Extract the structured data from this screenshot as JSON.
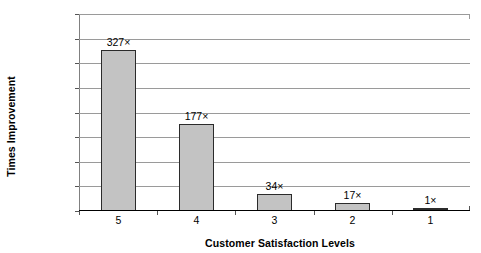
{
  "chart_data": {
    "type": "bar",
    "title": "",
    "subtitle": "",
    "xlabel": "Customer Satisfaction Levels",
    "ylabel": "Times Improvement",
    "categories": [
      "5",
      "4",
      "3",
      "2",
      "1"
    ],
    "values": [
      327,
      177,
      34,
      17,
      1
    ],
    "data_labels": [
      "327×",
      "177×",
      "34×",
      "17×",
      "1×"
    ],
    "ylim": [
      0,
      400
    ],
    "ytick_step": 50,
    "ytick_labels": [
      "400",
      "350",
      "300",
      "250",
      "200",
      "150",
      "100",
      "50",
      "0"
    ],
    "ytick_values": [
      400,
      350,
      300,
      250,
      200,
      150,
      100,
      50,
      0
    ],
    "grid": "horizontal",
    "legend": "none",
    "series": [
      {
        "name": "Times Improvement",
        "values": [
          327,
          177,
          34,
          17,
          1
        ]
      }
    ],
    "colors": {
      "bar_fill": "#c3c3c3",
      "bar_border": "#2b2b2b",
      "gridline": "#9a9a9a",
      "axis": "#000000",
      "text": "#000000",
      "background": "#ffffff"
    }
  }
}
